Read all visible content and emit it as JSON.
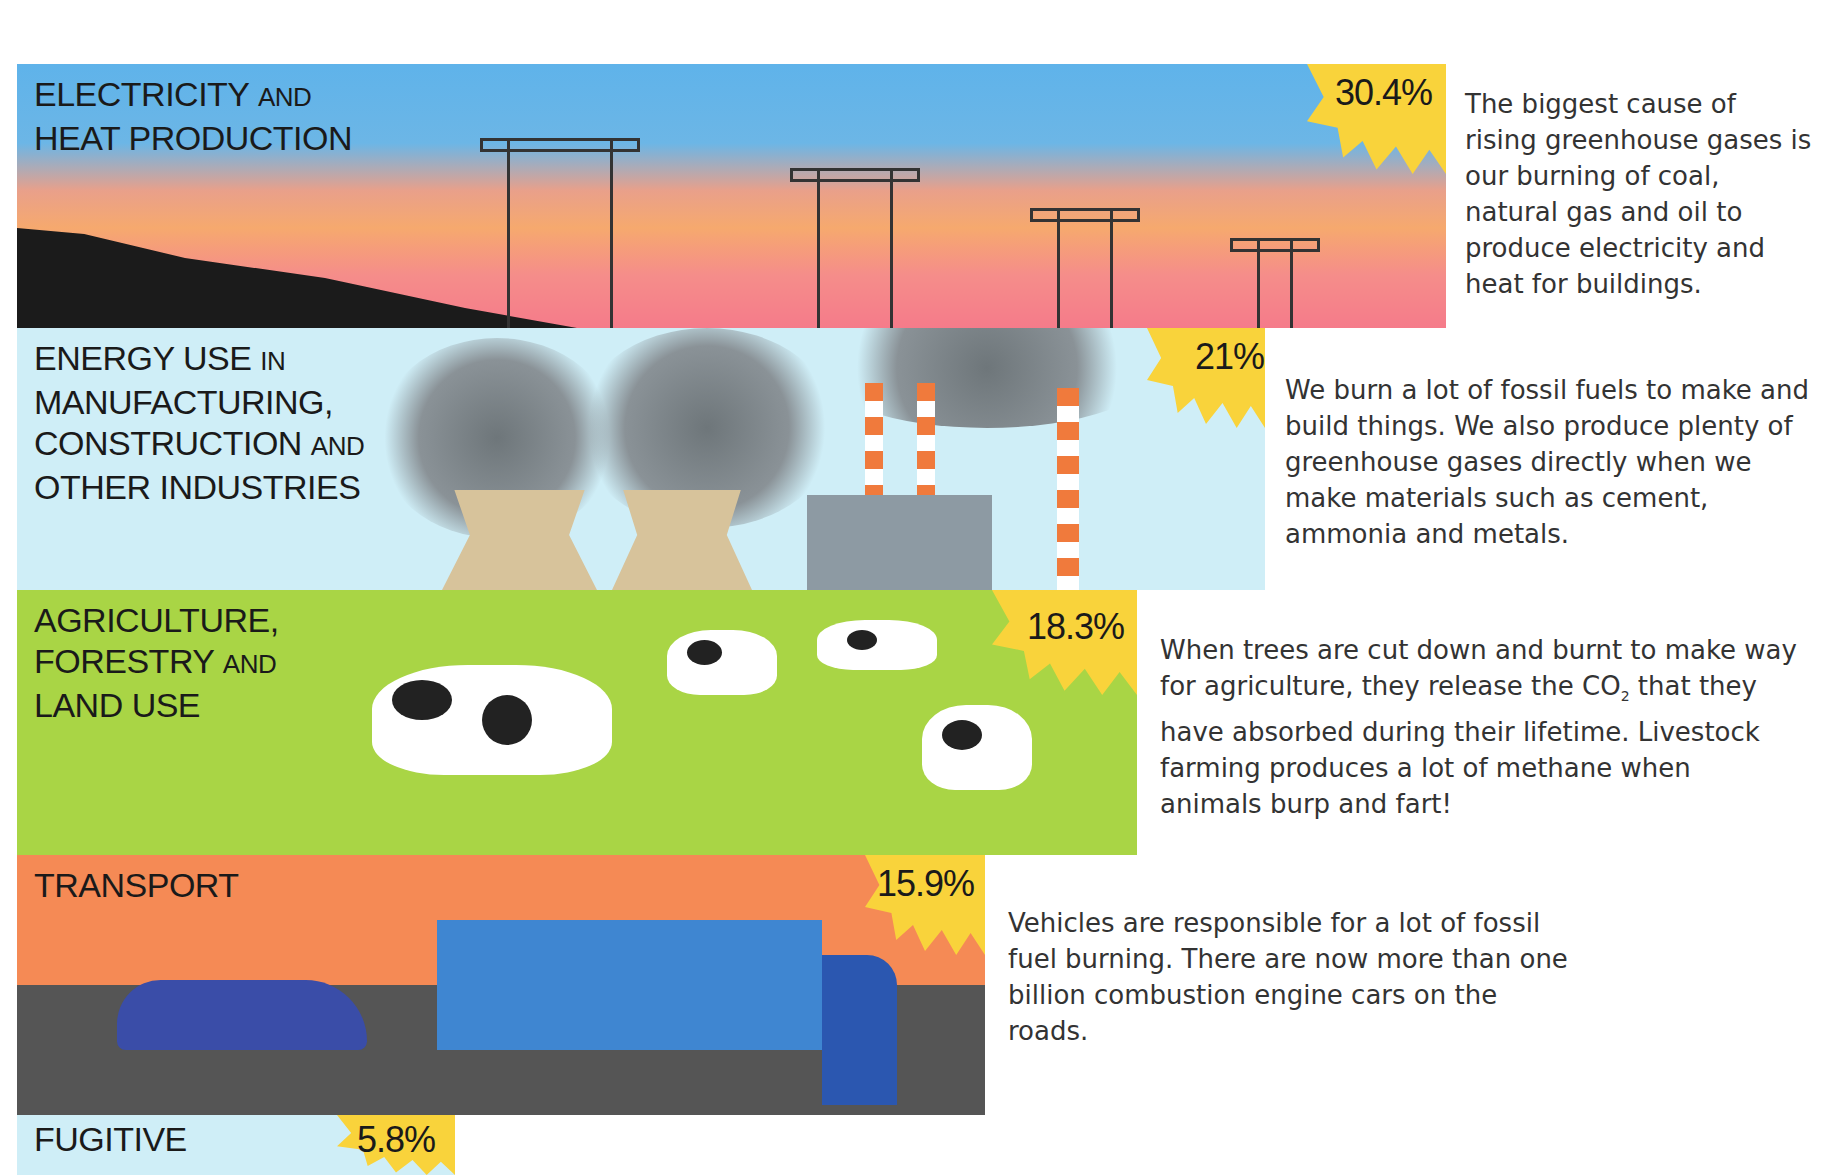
{
  "sectors": [
    {
      "label_main": "ELECTRICITY",
      "label_small": "AND",
      "label_line2": "HEAT PRODUCTION",
      "percent": "30.4%",
      "description": "The biggest cause of rising greenhouse gases is our burning of coal, natural gas and oil to produce electricity and heat for buildings.",
      "color": "#5fb3ea"
    },
    {
      "label_main": "ENERGY USE",
      "label_small": "IN",
      "label_line2": "MANUFACTURING,",
      "label_line3_main": "CONSTRUCTION",
      "label_line3_small": "AND",
      "label_line4": "OTHER INDUSTRIES",
      "percent": "21%",
      "description": "We burn a lot of fossil fuels to make and build things. We also produce plenty of greenhouse gases directly when we make materials such as cement, ammonia and metals.",
      "color": "#cfeef7"
    },
    {
      "label_main": "AGRICULTURE,",
      "label_line2_main": "FORESTRY",
      "label_line2_small": "AND",
      "label_line3": "LAND USE",
      "percent": "18.3%",
      "description_part1": "When trees are cut down and burnt to make way for agriculture, they release the CO",
      "description_sub": "2",
      "description_part2": " that they have absorbed during their lifetime. Livestock farming produces a lot of methane when animals burp and fart!",
      "color": "#a9d545"
    },
    {
      "label_main": "TRANSPORT",
      "percent": "15.9%",
      "description": "Vehicles are responsible for a lot of fossil fuel burning. There are now more than one billion combustion engine cars on the roads.",
      "color": "#f58a55"
    },
    {
      "label_main": "FUGITIVE",
      "percent": "5.8%",
      "color": "#cfeef7"
    }
  ],
  "badge_color": "#f9d33b"
}
